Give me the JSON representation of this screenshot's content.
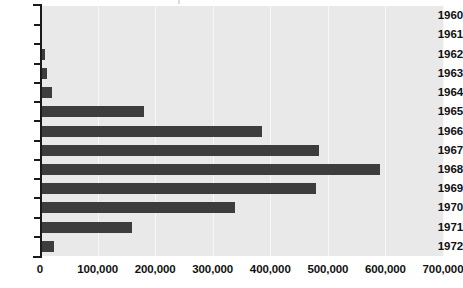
{
  "chart_data": {
    "type": "bar",
    "orientation": "horizontal",
    "title": "",
    "subtitle": "",
    "xlabel": "",
    "ylabel": "",
    "categories": [
      "1960",
      "1961",
      "1962",
      "1963",
      "1964",
      "1965",
      "1966",
      "1967",
      "1968",
      "1969",
      "1970",
      "1971",
      "1972"
    ],
    "values": [
      0,
      3000,
      9000,
      13000,
      20000,
      180000,
      385000,
      485000,
      590000,
      480000,
      338000,
      160000,
      25000
    ],
    "xlim": [
      0,
      700000
    ],
    "ylim": null,
    "xticks": [
      0,
      100000,
      200000,
      300000,
      400000,
      500000,
      600000,
      700000
    ],
    "xtick_labels": [
      "0",
      "100,000",
      "200,000",
      "300,000",
      "400,000",
      "500,000",
      "600,000",
      "700,000"
    ],
    "grid": true,
    "grid_axis": "x",
    "legend": null,
    "legend_position": "none",
    "series": [
      {
        "name": "",
        "values": [
          0,
          3000,
          9000,
          13000,
          20000,
          180000,
          385000,
          480000,
          590000,
          480000,
          338000,
          160000,
          25000
        ]
      }
    ],
    "annotations": []
  },
  "colors": {
    "bar": "#3d3d3d",
    "plot_background": "#e9e9e9",
    "gridline": "#f7f7f7",
    "axis": "#1a1a1a",
    "text": "#111111",
    "page_background": "#ffffff"
  }
}
